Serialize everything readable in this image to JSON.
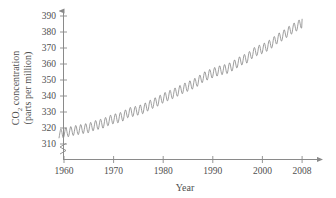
{
  "chart_data": {
    "type": "line",
    "title": "",
    "xlabel": "Year",
    "ylabel": "CO2 concentration (parts per million)",
    "ylabel_line1": "CO",
    "ylabel_sub": "2",
    "ylabel_line1_rest": " concentration",
    "ylabel_line2": "(parts per million)",
    "xlim": [
      1958,
      2010
    ],
    "ylim": [
      305,
      394
    ],
    "grid": false,
    "legend": null,
    "axis_break_y": true,
    "xticks": [
      1960,
      1970,
      1980,
      1990,
      2000,
      2008
    ],
    "xtick_labels": [
      "1960",
      "1970",
      "1980",
      "1990",
      "2000",
      "2008"
    ],
    "yticks": [
      310,
      320,
      330,
      340,
      350,
      360,
      370,
      380,
      390
    ],
    "ytick_labels": [
      "310",
      "320",
      "330",
      "340",
      "350",
      "360",
      "370",
      "380",
      "390"
    ],
    "line_color": "#8c8c8c",
    "axis_color": "#8a8a8a",
    "text_color": "#4f4f4f",
    "series": [
      {
        "name": "Mauna Loa CO2 (monthly mean)",
        "seasonal_amplitude": 3.0,
        "x": [
          1959.0,
          1960.0,
          1961.0,
          1962.0,
          1963.0,
          1964.0,
          1965.0,
          1966.0,
          1967.0,
          1968.0,
          1969.0,
          1970.0,
          1971.0,
          1972.0,
          1973.0,
          1974.0,
          1975.0,
          1976.0,
          1977.0,
          1978.0,
          1979.0,
          1980.0,
          1981.0,
          1982.0,
          1983.0,
          1984.0,
          1985.0,
          1986.0,
          1987.0,
          1988.0,
          1989.0,
          1990.0,
          1991.0,
          1992.0,
          1993.0,
          1994.0,
          1995.0,
          1996.0,
          1997.0,
          1998.0,
          1999.0,
          2000.0,
          2001.0,
          2002.0,
          2003.0,
          2004.0,
          2005.0,
          2006.0,
          2007.0,
          2008.0
        ],
        "values": [
          315.9,
          316.9,
          317.6,
          318.4,
          318.9,
          319.6,
          320.0,
          321.4,
          322.2,
          323.0,
          324.6,
          325.7,
          326.3,
          327.5,
          329.7,
          330.2,
          331.1,
          332.0,
          333.8,
          335.4,
          336.8,
          338.7,
          340.1,
          341.4,
          343.0,
          344.6,
          346.0,
          347.4,
          349.2,
          351.6,
          353.1,
          354.4,
          355.6,
          356.4,
          357.1,
          358.8,
          360.8,
          362.6,
          363.7,
          366.7,
          368.4,
          369.5,
          371.1,
          373.2,
          375.8,
          377.5,
          379.8,
          381.9,
          383.8,
          385.6
        ]
      }
    ]
  }
}
